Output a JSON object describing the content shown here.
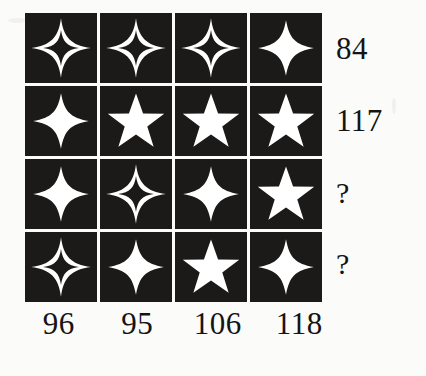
{
  "page": {
    "background_color": "#fbfbfa",
    "cell_color": "#1c1a18",
    "shape_color": "#ffffff",
    "text_color": "#141414"
  },
  "grid": {
    "rows": 4,
    "columns": 4,
    "cells": [
      [
        {
          "shape": "four-point-star-outline",
          "points": 4,
          "style": "outline"
        },
        {
          "shape": "four-point-star-outline",
          "points": 4,
          "style": "outline"
        },
        {
          "shape": "four-point-star-outline",
          "points": 4,
          "style": "outline"
        },
        {
          "shape": "four-point-star-solid",
          "points": 4,
          "style": "solid"
        }
      ],
      [
        {
          "shape": "four-point-star-solid",
          "points": 4,
          "style": "solid"
        },
        {
          "shape": "five-point-star-solid",
          "points": 5,
          "style": "solid"
        },
        {
          "shape": "five-point-star-solid",
          "points": 5,
          "style": "solid"
        },
        {
          "shape": "five-point-star-solid",
          "points": 5,
          "style": "solid"
        }
      ],
      [
        {
          "shape": "four-point-star-solid",
          "points": 4,
          "style": "solid"
        },
        {
          "shape": "four-point-star-outline",
          "points": 4,
          "style": "outline"
        },
        {
          "shape": "four-point-star-solid",
          "points": 4,
          "style": "solid"
        },
        {
          "shape": "five-point-star-solid",
          "points": 5,
          "style": "solid"
        }
      ],
      [
        {
          "shape": "four-point-star-outline",
          "points": 4,
          "style": "outline"
        },
        {
          "shape": "four-point-star-solid",
          "points": 4,
          "style": "solid"
        },
        {
          "shape": "five-point-star-solid",
          "points": 5,
          "style": "solid"
        },
        {
          "shape": "four-point-star-solid",
          "points": 4,
          "style": "solid"
        }
      ]
    ]
  },
  "row_sums": [
    "84",
    "117",
    "?",
    "?"
  ],
  "column_sums": [
    "96",
    "95",
    "106",
    "118"
  ]
}
